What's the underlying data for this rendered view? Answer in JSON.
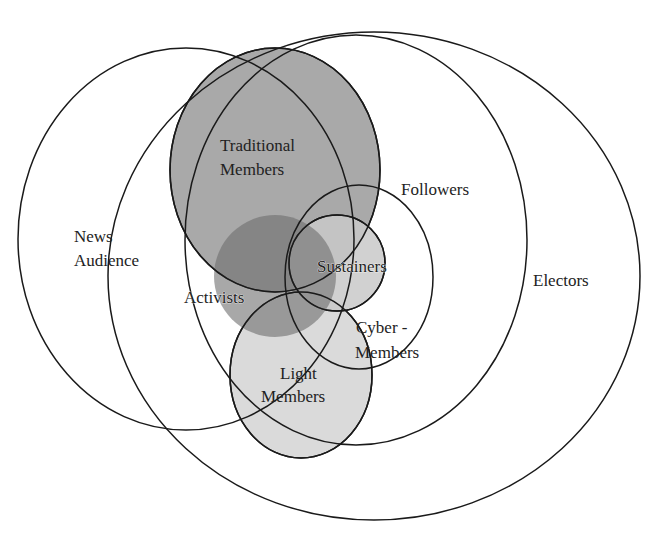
{
  "diagram": {
    "type": "venn-euler",
    "sets": [
      {
        "id": "news-audience",
        "label_lines": [
          "News",
          "Audience"
        ],
        "fill": "none"
      },
      {
        "id": "electors",
        "label_lines": [
          "Electors"
        ],
        "fill": "none"
      },
      {
        "id": "followers",
        "label_lines": [
          "Followers"
        ],
        "fill": "none"
      },
      {
        "id": "traditional-members",
        "label_lines": [
          "Traditional",
          "Members"
        ],
        "fill": "#a9a9a9"
      },
      {
        "id": "activists",
        "label_lines": [
          "Activists"
        ],
        "fill": "#7f7f7f"
      },
      {
        "id": "sustainers",
        "label_lines": [
          "Sustainers"
        ],
        "fill": "#c8c8c8"
      },
      {
        "id": "cyber-members",
        "label_lines": [
          "Cyber -",
          "Members"
        ],
        "fill": "none"
      },
      {
        "id": "light-members",
        "label_lines": [
          "Light",
          "Members"
        ],
        "fill": "#d9d9d9"
      }
    ]
  },
  "labels": {
    "news_1": "News",
    "news_2": "Audience",
    "electors": "Electors",
    "followers": "Followers",
    "traditional_1": "Traditional",
    "traditional_2": "Members",
    "activists": "Activists",
    "sustainers": "Sustainers",
    "cyber_1": "Cyber -",
    "cyber_2": "Members",
    "light_1": "Light",
    "light_2": "Members"
  },
  "colors": {
    "stroke": "#1a1a1a",
    "traditional_fill": "#a9a9a9",
    "activists_fill": "#6e6e6e",
    "sustainers_fill": "#c9c9c9",
    "light_fill": "#dadada"
  }
}
